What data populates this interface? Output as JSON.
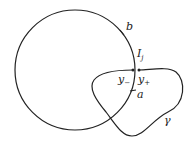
{
  "diagram": {
    "circle": {
      "cx": 75,
      "cy": 70,
      "r": 60,
      "stroke": "#222222"
    },
    "labels": {
      "b": "b",
      "I_main": "I",
      "I_sub": "j",
      "y_minus_main": "y",
      "y_minus_sub": "−",
      "y_plus_main": "y",
      "y_plus_sub": "+",
      "a": "a",
      "gamma": "γ"
    }
  }
}
